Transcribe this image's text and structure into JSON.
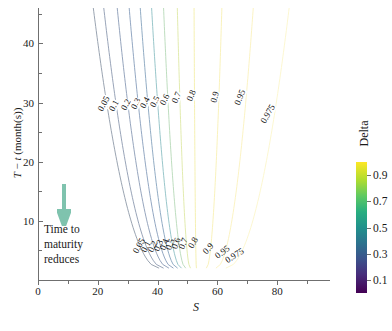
{
  "chart_data": {
    "type": "line",
    "title": "",
    "subtitle": "",
    "xlabel": "S",
    "ylabel": "T − t (month(s))",
    "xlim": [
      0,
      97
    ],
    "ylim": [
      0,
      46
    ],
    "xticks": [
      0,
      20,
      40,
      60,
      80
    ],
    "yticks": [
      10,
      20,
      30,
      40
    ],
    "grid": false,
    "legend_position": "right-colorbar",
    "colorbar": {
      "label": "Delta",
      "ticks": [
        0.1,
        0.3,
        0.5,
        0.7,
        0.9
      ],
      "vmin": 0.0,
      "vmax": 1.0,
      "colormap": "viridis"
    },
    "contour_levels": [
      0.05,
      0.1,
      0.2,
      0.3,
      0.4,
      0.5,
      0.6,
      0.7,
      0.8,
      0.9,
      0.95,
      0.975
    ],
    "contours": [
      {
        "level": "0.05",
        "color": "#8e9aa8",
        "x_at_top": 18.5,
        "x_at_bottom": 40.5
      },
      {
        "level": "0.1",
        "color": "#8d9ab0",
        "x_at_top": 22.0,
        "x_at_bottom": 42.0
      },
      {
        "level": "0.2",
        "color": "#8a9bb6",
        "x_at_top": 26.5,
        "x_at_bottom": 43.8
      },
      {
        "level": "0.3",
        "color": "#879dbb",
        "x_at_top": 30.5,
        "x_at_bottom": 45.3
      },
      {
        "level": "0.4",
        "color": "#86a3bd",
        "x_at_top": 34.2,
        "x_at_bottom": 46.7
      },
      {
        "level": "0.5",
        "color": "#8dc0c4",
        "x_at_top": 38.0,
        "x_at_bottom": 48.0
      },
      {
        "level": "0.6",
        "color": "#b7d9b8",
        "x_at_top": 42.0,
        "x_at_bottom": 49.4
      },
      {
        "level": "0.7",
        "color": "#dfe9a6",
        "x_at_top": 46.6,
        "x_at_bottom": 51.0
      },
      {
        "level": "0.8",
        "color": "#f4eeaa",
        "x_at_top": 52.2,
        "x_at_bottom": 53.0
      },
      {
        "level": "0.9",
        "color": "#f8f0b4",
        "x_at_top": 61.5,
        "x_at_bottom": 56.3
      },
      {
        "level": "0.95",
        "color": "#faf2bd",
        "x_at_top": 72.0,
        "x_at_bottom": 59.5
      },
      {
        "level": "0.975",
        "color": "#fcf6cc",
        "x_at_top": 84.0,
        "x_at_bottom": 62.8
      }
    ],
    "upper_label_values": [
      "0.05",
      "0.1",
      "0.2",
      "0.3",
      "0.4",
      "0.5",
      "0.6",
      "0.7",
      "0.8",
      "0.9",
      "0.95",
      "0.975"
    ],
    "lower_label_values": [
      "0.05",
      "0.1",
      "0.2",
      "0.3",
      "0.4",
      "0.5",
      "0.6",
      "0.7",
      "0.8",
      "0.9",
      "0.95",
      "0.975"
    ]
  },
  "annotation": {
    "line1": "Time to",
    "line2": "maturity",
    "line3": "reduces",
    "arrow_color": "#7fc3ae",
    "arrow_direction": "down"
  },
  "axes": {
    "x_title": "S",
    "y_title_prefix": "T",
    "y_title_middle": " − ",
    "y_title_italic2": "t",
    "y_title_suffix": " (month(s))",
    "x_tick_labels": [
      "0",
      "20",
      "40",
      "60",
      "80"
    ],
    "y_tick_labels": [
      "10",
      "20",
      "30",
      "40"
    ]
  },
  "colorbar": {
    "title": "Delta",
    "tick_labels": [
      "0.9",
      "0.7",
      "0.5",
      "0.3",
      "0.1"
    ]
  }
}
